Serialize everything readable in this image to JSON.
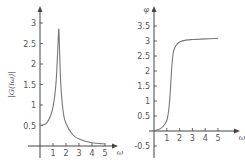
{
  "chart_data": [
    {
      "type": "line",
      "title": "",
      "xlabel": "ω",
      "ylabel": "|G(iω)|",
      "xlim": [
        -0.9,
        5.6
      ],
      "ylim": [
        -0.15,
        3.5
      ],
      "x_ticks": [
        "1",
        "2",
        "3",
        "4",
        "5"
      ],
      "y_ticks": [
        "0.5",
        "1",
        "1.5",
        "2",
        "2.5",
        "3"
      ],
      "grid": false,
      "series": [
        {
          "name": "|G(iω)|",
          "x": [
            0,
            0.25,
            0.5,
            0.75,
            1.0,
            1.2,
            1.3,
            1.4,
            1.45,
            1.5,
            1.6,
            1.8,
            2.0,
            2.5,
            3.0,
            4.0,
            5.0
          ],
          "y": [
            0.5,
            0.52,
            0.56,
            0.69,
            0.95,
            1.42,
            1.9,
            2.6,
            2.85,
            2.4,
            1.5,
            0.8,
            0.55,
            0.28,
            0.17,
            0.08,
            0.05
          ]
        }
      ]
    },
    {
      "type": "line",
      "title": "",
      "xlabel": "ω",
      "ylabel": "φ",
      "xlim": [
        -0.3,
        5.8
      ],
      "ylim": [
        -0.7,
        3.9
      ],
      "x_ticks": [
        "1",
        "2",
        "3",
        "4",
        "5"
      ],
      "y_ticks": [
        "-0.5",
        "0.5",
        "1",
        "1.5",
        "2",
        "2.5",
        "3",
        "3.5"
      ],
      "grid": false,
      "series": [
        {
          "name": "φ",
          "x": [
            0,
            0.5,
            0.8,
            1.0,
            1.1,
            1.2,
            1.3,
            1.4,
            1.5,
            1.6,
            1.8,
            2.0,
            2.5,
            3.0,
            4.0,
            5.0
          ],
          "y": [
            0,
            0.08,
            0.2,
            0.35,
            0.55,
            0.9,
            1.5,
            2.2,
            2.6,
            2.75,
            2.9,
            2.97,
            3.03,
            3.05,
            3.07,
            3.09
          ]
        }
      ]
    }
  ],
  "labels": {
    "left_ylabel": "|G(iω)|",
    "left_xlabel": "ω",
    "right_ylabel": "φ",
    "right_xlabel": "ω"
  }
}
